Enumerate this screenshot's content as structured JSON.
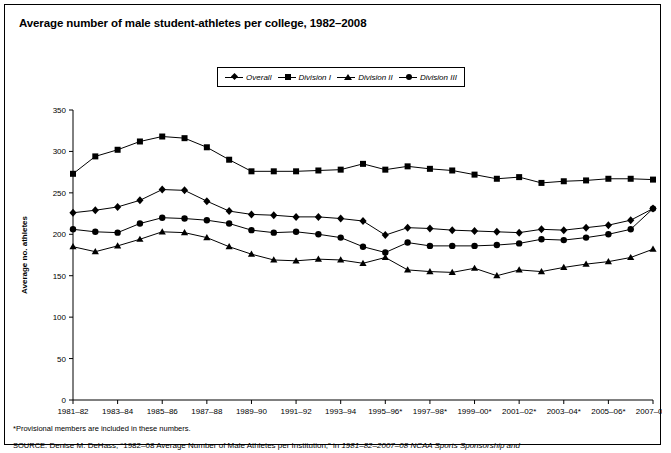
{
  "figure": {
    "title": "Average number of male student-athletes per college, 1982–2008",
    "footnote": "*Provisional members are included in these numbers.",
    "source_prefix": "SOURCE:",
    "source_text": "Denise M. DeHass, “1982–08 Average Number of Male Athletes per Institution,” in",
    "source_italic": "1981–82–2007–08 NCAA Sports Sponsorship and"
  },
  "legend": {
    "position": "top-center",
    "items": [
      {
        "label": "Overall",
        "marker": "diamond"
      },
      {
        "label": "Division I",
        "marker": "square"
      },
      {
        "label": "Division II",
        "marker": "triangle"
      },
      {
        "label": "Division III",
        "marker": "circle"
      }
    ]
  },
  "chart_data": {
    "type": "line",
    "title": "Average number of male student-athletes per college, 1982–2008",
    "xlabel": "",
    "ylabel": "Average no. athletes",
    "ylim": [
      0,
      350
    ],
    "yticks": [
      0,
      50,
      100,
      150,
      200,
      250,
      300,
      350
    ],
    "grid": false,
    "x": [
      "1981–82",
      "1982–83",
      "1983–84",
      "1984–85",
      "1985–86",
      "1986–87",
      "1987–88",
      "1988–89",
      "1989–90",
      "1990–91",
      "1991–92",
      "1992–93",
      "1993–94",
      "1994–95",
      "1995–96*",
      "1996–97*",
      "1997–98*",
      "1998–99*",
      "1999–00*",
      "2000–01*",
      "2001–02*",
      "2002–03*",
      "2003–04*",
      "2004–05*",
      "2005–06*",
      "2006–07*",
      "2007–08*"
    ],
    "xticklabels": [
      "1981–82",
      "1983–84",
      "1985–86",
      "1987–88",
      "1989–90",
      "1991–92",
      "1993–94",
      "1995–96*",
      "1997–98*",
      "1999–00*",
      "2001–02*",
      "2003–04*",
      "2005–06*",
      "2007–08*"
    ],
    "series": [
      {
        "name": "Overall",
        "marker": "diamond",
        "values": [
          226,
          229,
          233,
          241,
          254,
          253,
          240,
          228,
          224,
          223,
          221,
          221,
          219,
          216,
          199,
          208,
          207,
          205,
          204,
          203,
          202,
          206,
          205,
          208,
          211,
          217,
          231
        ]
      },
      {
        "name": "Division I",
        "marker": "square",
        "values": [
          273,
          294,
          302,
          312,
          318,
          316,
          305,
          290,
          276,
          276,
          276,
          277,
          278,
          285,
          278,
          282,
          279,
          277,
          272,
          267,
          269,
          262,
          264,
          265,
          267,
          267,
          266
        ]
      },
      {
        "name": "Division II",
        "marker": "triangle",
        "values": [
          185,
          179,
          186,
          194,
          203,
          202,
          196,
          185,
          176,
          169,
          168,
          170,
          169,
          165,
          172,
          157,
          155,
          154,
          159,
          150,
          157,
          155,
          160,
          164,
          167,
          172,
          182
        ]
      },
      {
        "name": "Division III",
        "marker": "circle",
        "values": [
          206,
          203,
          202,
          213,
          220,
          219,
          217,
          213,
          205,
          202,
          203,
          200,
          196,
          185,
          178,
          190,
          186,
          186,
          186,
          187,
          189,
          194,
          193,
          196,
          200,
          206,
          231
        ]
      }
    ]
  }
}
